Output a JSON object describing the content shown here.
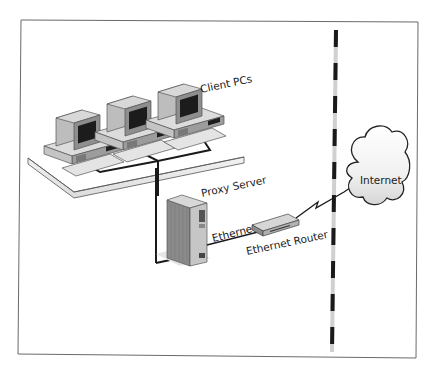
{
  "diagram": {
    "labels": {
      "client_pcs": "Client PCs",
      "proxy_server": "Proxy Server",
      "ethernet": "Ethernet",
      "ethernet_router": "Ethernet Router",
      "internet": "Internet"
    },
    "nodes": [
      {
        "id": "client-pc-1",
        "type": "desktop-pc"
      },
      {
        "id": "client-pc-2",
        "type": "desktop-pc"
      },
      {
        "id": "client-pc-3",
        "type": "desktop-pc"
      },
      {
        "id": "proxy-server",
        "type": "tower-server"
      },
      {
        "id": "ethernet-router",
        "type": "router"
      },
      {
        "id": "internet",
        "type": "cloud"
      }
    ],
    "edges": [
      {
        "from": "client-pc-1",
        "to": "proxy-server",
        "kind": "lan"
      },
      {
        "from": "client-pc-2",
        "to": "proxy-server",
        "kind": "lan"
      },
      {
        "from": "client-pc-3",
        "to": "proxy-server",
        "kind": "lan"
      },
      {
        "from": "proxy-server",
        "to": "ethernet-router",
        "kind": "ethernet"
      },
      {
        "from": "ethernet-router",
        "to": "internet",
        "kind": "wan-lightning"
      }
    ],
    "colors": {
      "line": "#1a1a1a",
      "pc_light": "#d4d4d4",
      "pc_mid": "#a8a8a8",
      "pc_dark": "#6e6e6e",
      "screen": "#1c1c1c",
      "barrier_dark": "#1a1a1a",
      "barrier_light": "#d0d0d0"
    }
  }
}
